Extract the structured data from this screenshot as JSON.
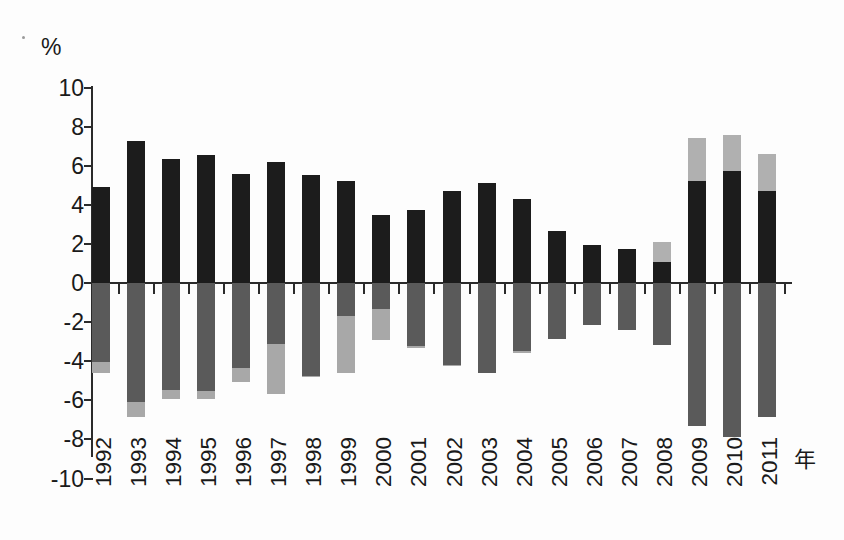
{
  "chart_data": {
    "type": "bar",
    "title": "",
    "subtitle": "",
    "xlabel": "年",
    "ylabel": "%",
    "ylim": [
      -10,
      10
    ],
    "grid": false,
    "legend_position": "none",
    "stacked": true,
    "y_ticks": [
      10,
      8,
      6,
      4,
      2,
      0,
      -2,
      -4,
      -6,
      -8,
      -10
    ],
    "y_tick_labels": [
      "10",
      "8",
      "6",
      "4",
      "2",
      "0",
      "-2",
      "-4",
      "-6",
      "-8",
      "-10"
    ],
    "categories": [
      "1992",
      "1993",
      "1994",
      "1995",
      "1996",
      "1997",
      "1998",
      "1999",
      "2000",
      "2001",
      "2002",
      "2003",
      "2004",
      "2005",
      "2006",
      "2007",
      "2008",
      "2009",
      "2010",
      "2011"
    ],
    "series": [
      {
        "name": "positive-dark",
        "color": "#1c1c1c",
        "values": [
          4.9,
          7.25,
          6.35,
          6.55,
          5.6,
          6.2,
          5.5,
          5.2,
          3.5,
          3.75,
          4.7,
          5.1,
          4.3,
          2.65,
          1.95,
          1.75,
          1.05,
          5.2,
          5.75,
          4.7
        ]
      },
      {
        "name": "positive-light",
        "color": "#b0b0b0",
        "values": [
          0,
          0,
          0,
          0,
          0,
          0,
          0,
          0,
          0,
          0,
          0,
          0,
          0,
          0.25,
          0.25,
          0.85,
          2.1,
          7.4,
          7.55,
          6.6
        ]
      },
      {
        "name": "negative-dark",
        "color": "#5a5a5a",
        "values": [
          -4.05,
          -6.1,
          -5.45,
          -5.5,
          -4.35,
          -3.1,
          -4.75,
          -1.7,
          -1.35,
          -3.2,
          -4.2,
          -4.6,
          -3.5,
          -2.85,
          -2.15,
          -2.4,
          -3.15,
          -7.3,
          -7.9,
          -6.85
        ]
      },
      {
        "name": "negative-light",
        "color": "#a8a8a8",
        "values": [
          -4.6,
          -6.85,
          -5.95,
          -5.95,
          -5.05,
          -5.7,
          -4.8,
          -4.6,
          -2.9,
          -3.3,
          -4.25,
          -4.6,
          -3.6,
          -2.85,
          -2.15,
          -2.4,
          -3.15,
          -7.3,
          -7.9,
          -6.85
        ]
      }
    ],
    "bar_tops": [
      4.9,
      7.25,
      6.35,
      6.55,
      5.6,
      6.2,
      5.5,
      5.2,
      3.5,
      3.75,
      4.7,
      5.1,
      4.3,
      2.9,
      2.2,
      2.6,
      3.15,
      7.4,
      7.55,
      6.6
    ],
    "bar_bottoms": [
      -4.6,
      -6.85,
      -5.95,
      -5.95,
      -5.05,
      -5.7,
      -4.8,
      -4.6,
      -2.9,
      -3.3,
      -4.25,
      -4.6,
      -3.6,
      -2.85,
      -2.15,
      -2.4,
      -3.15,
      -7.3,
      -7.9,
      -6.85
    ]
  },
  "axis": {
    "unit_label": "%",
    "x_title": "年"
  }
}
